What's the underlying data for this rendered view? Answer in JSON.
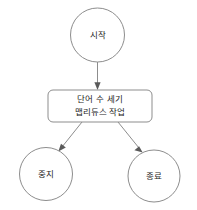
{
  "diagram": {
    "type": "flowchart",
    "background_color": "#ffffff",
    "stroke_color": "#8d8d8d",
    "text_color": "#1c1c1c",
    "nodes": [
      {
        "id": "start",
        "label": "시작",
        "shape": "circle",
        "name": "start-node"
      },
      {
        "id": "process",
        "label_line1": "단어 수 세기",
        "label_line2": "맵리듀스 작업",
        "shape": "rounded-rectangle",
        "name": "process-node"
      },
      {
        "id": "stop",
        "label": "중지",
        "shape": "circle",
        "name": "stop-node"
      },
      {
        "id": "end",
        "label": "종료",
        "shape": "circle",
        "name": "end-node"
      }
    ],
    "edges": [
      {
        "from": "start",
        "to": "process",
        "name": "edge-start-to-process"
      },
      {
        "from": "process",
        "to": "stop",
        "name": "edge-process-to-stop"
      },
      {
        "from": "process",
        "to": "end",
        "name": "edge-process-to-end"
      }
    ]
  }
}
